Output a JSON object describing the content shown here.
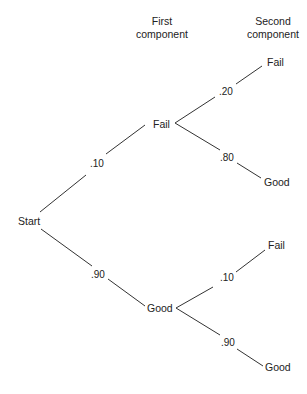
{
  "headers": {
    "first": [
      "First",
      "component"
    ],
    "second": [
      "Second",
      "component"
    ]
  },
  "root": {
    "label": "Start"
  },
  "first_level": [
    {
      "label": "Fail",
      "prob": ".10",
      "children": [
        {
          "label": "Fail",
          "prob": ".20"
        },
        {
          "label": "Good",
          "prob": ".80"
        }
      ]
    },
    {
      "label": "Good",
      "prob": ".90",
      "children": [
        {
          "label": "Fail",
          "prob": ".10"
        },
        {
          "label": "Good",
          "prob": ".90"
        }
      ]
    }
  ],
  "colors": {
    "line": "#333333",
    "text": "#222222",
    "background": "#ffffff"
  }
}
